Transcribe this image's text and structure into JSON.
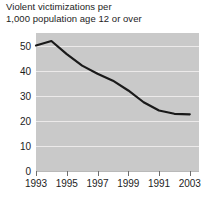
{
  "chart_data": {
    "type": "line",
    "title": "Violent victimizations per\n1,000 population age 12 or over",
    "title_line1": "Violent victimizations per",
    "title_line2": "1,000 population age 12 or over",
    "xlabel": "",
    "ylabel": "",
    "ylim": [
      0,
      55
    ],
    "xlim": [
      1993,
      2003.6
    ],
    "yticks": [
      0,
      10,
      20,
      30,
      40,
      50
    ],
    "ytick_labels": [
      "0",
      "10",
      "20",
      "30",
      "40",
      "50"
    ],
    "xticks": [
      1993,
      1995,
      1997,
      1999,
      2001,
      2003
    ],
    "xtick_labels": [
      "1993",
      "1995",
      "1997",
      "1999",
      "1991",
      "2003"
    ],
    "grid": true,
    "grid_color": "#eceaea",
    "plot_background": "#c9c9c9",
    "line_color": "#1a1a1a",
    "line_width": 2.2,
    "legend": null,
    "x": [
      1993,
      1994,
      1995,
      1996,
      1997,
      1998,
      1999,
      2000,
      2001,
      2002,
      2003
    ],
    "values": [
      50.0,
      51.8,
      46.6,
      42.0,
      38.8,
      36.0,
      32.1,
      27.4,
      24.1,
      22.8,
      22.6
    ],
    "series": [
      {
        "name": "Violent victimization rate",
        "values": [
          50.0,
          51.8,
          46.6,
          42.0,
          38.8,
          36.0,
          32.1,
          27.4,
          24.1,
          22.8,
          22.6
        ]
      }
    ]
  }
}
